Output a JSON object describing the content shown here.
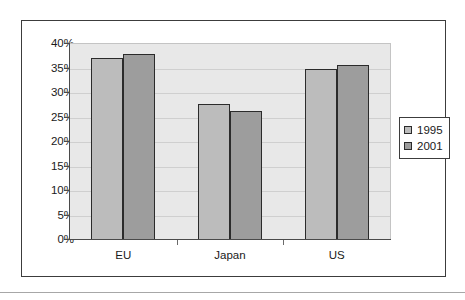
{
  "chart_data": {
    "type": "bar",
    "title": "",
    "xlabel": "",
    "ylabel": "",
    "categories": [
      "EU",
      "Japan",
      "US"
    ],
    "series": [
      {
        "name": "1995",
        "color": "#bcbcbc",
        "values": [
          37.2,
          27.8,
          34.9
        ]
      },
      {
        "name": "2001",
        "color": "#9d9d9d",
        "values": [
          37.9,
          26.3,
          35.7
        ]
      }
    ],
    "ylim": [
      0,
      40
    ],
    "ytick_values": [
      0,
      5,
      10,
      15,
      20,
      25,
      30,
      35,
      40
    ],
    "ytick_labels": [
      "0%",
      "5%",
      "10%",
      "15%",
      "20%",
      "25%",
      "30%",
      "35%",
      "40%"
    ],
    "grid": true,
    "legend_position": "right",
    "plot_background": "#e8e8e8",
    "axis_color": "#4a4a4a",
    "gridline_color": "#cfcfcf",
    "bar_border_color": "#2b2b2b"
  },
  "legend": {
    "entries": [
      {
        "label": "1995",
        "swatch": "legend-swatch-1995"
      },
      {
        "label": "2001",
        "swatch": "legend-swatch-2001"
      }
    ]
  }
}
